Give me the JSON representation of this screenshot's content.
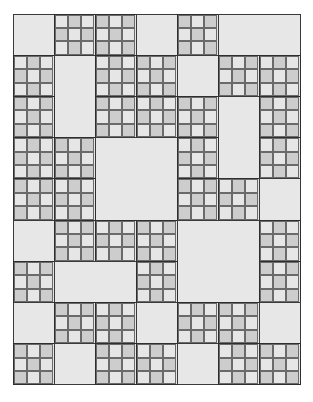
{
  "grid": {
    "columns": 7,
    "rows": 9,
    "colors": {
      "plain": "#e7e7e7",
      "sub_light": "#e6e6e6",
      "sub_dark": "#cdcdcd",
      "border": "#3a3a3a"
    },
    "blocks": [
      {
        "type": "plain",
        "row": 0,
        "col": 0,
        "rowspan": 1,
        "colspan": 1
      },
      {
        "type": "checker",
        "row": 0,
        "col": 1,
        "rowspan": 1,
        "colspan": 1
      },
      {
        "type": "checker",
        "row": 0,
        "col": 2,
        "rowspan": 1,
        "colspan": 1
      },
      {
        "type": "plain",
        "row": 0,
        "col": 3,
        "rowspan": 1,
        "colspan": 1
      },
      {
        "type": "checker",
        "row": 0,
        "col": 4,
        "rowspan": 1,
        "colspan": 1
      },
      {
        "type": "plain",
        "row": 0,
        "col": 5,
        "rowspan": 1,
        "colspan": 2
      },
      {
        "type": "checker",
        "row": 1,
        "col": 0,
        "rowspan": 1,
        "colspan": 1
      },
      {
        "type": "plain",
        "row": 1,
        "col": 1,
        "rowspan": 2,
        "colspan": 1
      },
      {
        "type": "checker",
        "row": 1,
        "col": 2,
        "rowspan": 1,
        "colspan": 1
      },
      {
        "type": "checker",
        "row": 1,
        "col": 3,
        "rowspan": 1,
        "colspan": 1
      },
      {
        "type": "plain",
        "row": 1,
        "col": 4,
        "rowspan": 1,
        "colspan": 1
      },
      {
        "type": "checker",
        "row": 1,
        "col": 5,
        "rowspan": 1,
        "colspan": 1
      },
      {
        "type": "checker",
        "row": 1,
        "col": 6,
        "rowspan": 1,
        "colspan": 1
      },
      {
        "type": "checker",
        "row": 2,
        "col": 0,
        "rowspan": 1,
        "colspan": 1
      },
      {
        "type": "checker",
        "row": 2,
        "col": 2,
        "rowspan": 1,
        "colspan": 1
      },
      {
        "type": "checker",
        "row": 2,
        "col": 3,
        "rowspan": 1,
        "colspan": 1
      },
      {
        "type": "checker",
        "row": 2,
        "col": 4,
        "rowspan": 1,
        "colspan": 1
      },
      {
        "type": "plain",
        "row": 2,
        "col": 5,
        "rowspan": 2,
        "colspan": 1
      },
      {
        "type": "checker",
        "row": 2,
        "col": 6,
        "rowspan": 1,
        "colspan": 1
      },
      {
        "type": "checker",
        "row": 3,
        "col": 0,
        "rowspan": 1,
        "colspan": 1
      },
      {
        "type": "checker",
        "row": 3,
        "col": 1,
        "rowspan": 1,
        "colspan": 1
      },
      {
        "type": "plain",
        "row": 3,
        "col": 2,
        "rowspan": 2,
        "colspan": 2
      },
      {
        "type": "checker",
        "row": 3,
        "col": 4,
        "rowspan": 1,
        "colspan": 1
      },
      {
        "type": "checker",
        "row": 3,
        "col": 6,
        "rowspan": 1,
        "colspan": 1
      },
      {
        "type": "checker",
        "row": 4,
        "col": 0,
        "rowspan": 1,
        "colspan": 1
      },
      {
        "type": "checker",
        "row": 4,
        "col": 1,
        "rowspan": 1,
        "colspan": 1
      },
      {
        "type": "checker",
        "row": 4,
        "col": 4,
        "rowspan": 1,
        "colspan": 1
      },
      {
        "type": "checker",
        "row": 4,
        "col": 5,
        "rowspan": 1,
        "colspan": 1
      },
      {
        "type": "plain",
        "row": 4,
        "col": 6,
        "rowspan": 1,
        "colspan": 1
      },
      {
        "type": "plain",
        "row": 5,
        "col": 0,
        "rowspan": 1,
        "colspan": 1
      },
      {
        "type": "checker",
        "row": 5,
        "col": 1,
        "rowspan": 1,
        "colspan": 1
      },
      {
        "type": "checker",
        "row": 5,
        "col": 2,
        "rowspan": 1,
        "colspan": 1
      },
      {
        "type": "checker",
        "row": 5,
        "col": 3,
        "rowspan": 1,
        "colspan": 1
      },
      {
        "type": "plain",
        "row": 5,
        "col": 4,
        "rowspan": 2,
        "colspan": 2
      },
      {
        "type": "checker",
        "row": 5,
        "col": 6,
        "rowspan": 1,
        "colspan": 1
      },
      {
        "type": "checker",
        "row": 6,
        "col": 0,
        "rowspan": 1,
        "colspan": 1
      },
      {
        "type": "plain",
        "row": 6,
        "col": 1,
        "rowspan": 1,
        "colspan": 2
      },
      {
        "type": "checker",
        "row": 6,
        "col": 3,
        "rowspan": 1,
        "colspan": 1
      },
      {
        "type": "checker",
        "row": 6,
        "col": 6,
        "rowspan": 1,
        "colspan": 1
      },
      {
        "type": "plain",
        "row": 7,
        "col": 0,
        "rowspan": 1,
        "colspan": 1
      },
      {
        "type": "checker",
        "row": 7,
        "col": 1,
        "rowspan": 1,
        "colspan": 1
      },
      {
        "type": "checker",
        "row": 7,
        "col": 2,
        "rowspan": 1,
        "colspan": 1
      },
      {
        "type": "plain",
        "row": 7,
        "col": 3,
        "rowspan": 1,
        "colspan": 1
      },
      {
        "type": "checker",
        "row": 7,
        "col": 4,
        "rowspan": 1,
        "colspan": 1
      },
      {
        "type": "checker",
        "row": 7,
        "col": 5,
        "rowspan": 1,
        "colspan": 1
      },
      {
        "type": "plain",
        "row": 7,
        "col": 6,
        "rowspan": 1,
        "colspan": 1
      },
      {
        "type": "checker",
        "row": 8,
        "col": 0,
        "rowspan": 1,
        "colspan": 1
      },
      {
        "type": "plain",
        "row": 8,
        "col": 1,
        "rowspan": 1,
        "colspan": 1
      },
      {
        "type": "checker",
        "row": 8,
        "col": 2,
        "rowspan": 1,
        "colspan": 1
      },
      {
        "type": "checker",
        "row": 8,
        "col": 3,
        "rowspan": 1,
        "colspan": 1
      },
      {
        "type": "plain",
        "row": 8,
        "col": 4,
        "rowspan": 1,
        "colspan": 1
      },
      {
        "type": "checker",
        "row": 8,
        "col": 5,
        "rowspan": 1,
        "colspan": 1
      },
      {
        "type": "checker",
        "row": 8,
        "col": 6,
        "rowspan": 1,
        "colspan": 1
      }
    ]
  }
}
